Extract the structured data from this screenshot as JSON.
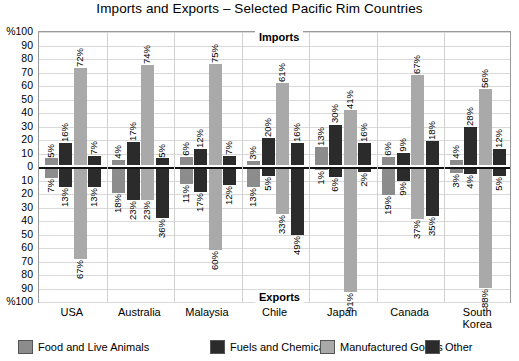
{
  "chart_data": {
    "type": "bar",
    "title": "Imports and Exports – Selected Pacific Rim Countries",
    "xlabel": "",
    "ylabel": "%",
    "ylim": [
      -100,
      100
    ],
    "grid": true,
    "legend_position": "bottom",
    "upper_region_label": "Imports",
    "lower_region_label": "Exports",
    "y_ticks": [
      "%100",
      "90",
      "80",
      "70",
      "60",
      "50",
      "40",
      "30",
      "20",
      "10",
      "0",
      "10",
      "20",
      "30",
      "40",
      "50",
      "60",
      "70",
      "80",
      "90",
      "%100"
    ],
    "categories": [
      "USA",
      "Australia",
      "Malaysia",
      "Chile",
      "Japan",
      "Canada",
      "South\nKorea"
    ],
    "series": [
      {
        "name": "Food and Live Animals",
        "color": "#8c8c8c",
        "imports": [
          5,
          4,
          6,
          3,
          13,
          6,
          4
        ],
        "exports": [
          7,
          18,
          11,
          13,
          1,
          19,
          3
        ],
        "import_labels": [
          "5%",
          "4%",
          "6%",
          "3%",
          "13%",
          "6%",
          "4%"
        ],
        "export_labels": [
          "7%",
          "18%",
          "11%",
          "13%",
          "1%",
          "19%",
          "3%"
        ]
      },
      {
        "name": "Fuels and Chemicals",
        "color": "#2b2b2b",
        "imports": [
          16,
          17,
          12,
          20,
          30,
          9,
          28
        ],
        "exports": [
          13,
          23,
          17,
          5,
          6,
          9,
          4
        ],
        "import_labels": [
          "16%",
          "17%",
          "12%",
          "20%",
          "30%",
          "9%",
          "28%"
        ],
        "export_labels": [
          "13%",
          "23%",
          "17%",
          "5%",
          "6%",
          "9%",
          "4%"
        ]
      },
      {
        "name": "Manufactured Goods",
        "color": "#a9a9a9",
        "imports": [
          72,
          74,
          75,
          61,
          41,
          67,
          56
        ],
        "exports": [
          67,
          23,
          60,
          33,
          91,
          37,
          88
        ],
        "import_labels": [
          "72%",
          "74%",
          "75%",
          "61%",
          "41%",
          "67%",
          "56%"
        ],
        "export_labels": [
          "67%",
          "23%",
          "60%",
          "33%",
          "91%",
          "37%",
          "88%"
        ]
      },
      {
        "name": "Other",
        "color": "#2b2b2b",
        "imports": [
          7,
          5,
          7,
          16,
          16,
          18,
          12
        ],
        "exports": [
          13,
          36,
          12,
          49,
          2,
          35,
          5
        ],
        "import_labels": [
          "7%",
          "5%",
          "7%",
          "16%",
          "16%",
          "18%",
          "12%"
        ],
        "export_labels": [
          "13%",
          "36%",
          "12%",
          "49%",
          "2%",
          "35%",
          "5%"
        ]
      }
    ]
  }
}
